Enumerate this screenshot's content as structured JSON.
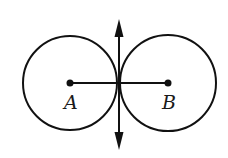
{
  "diagram": {
    "stroke_color": "#111111",
    "background": "#ffffff",
    "circles": [
      {
        "name": "A",
        "cx": 70,
        "cy": 83,
        "r": 47
      },
      {
        "name": "B",
        "cx": 168,
        "cy": 83,
        "r": 48
      }
    ],
    "points": [
      {
        "label": "A",
        "x": 70,
        "y": 83
      },
      {
        "label": "B",
        "x": 168,
        "y": 83
      }
    ],
    "segment_AB": {
      "x1": 70,
      "y1": 83,
      "x2": 168,
      "y2": 83
    },
    "tangent_line": {
      "x": 119,
      "y_top": 19,
      "y_bottom": 150,
      "arrows": "both"
    },
    "labels": {
      "A": "A",
      "B": "B"
    }
  }
}
